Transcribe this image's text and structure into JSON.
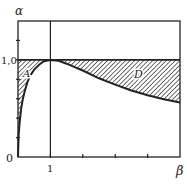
{
  "diagram": {
    "y_axis_label": "α",
    "x_axis_label": "β",
    "y_tick_label_one": "1,0",
    "origin_label": "0",
    "x_tick_label_one": "1",
    "region_labels": {
      "left": "A",
      "right": "D"
    },
    "x_range": [
      0,
      5
    ],
    "y_range": [
      0,
      1.4
    ],
    "x_ticks": [
      1,
      2,
      3,
      4
    ],
    "y_ticks": [
      0.2,
      0.4,
      0.6,
      0.8,
      1.0,
      1.2
    ],
    "reference_level": 1.0,
    "reference_beta": 1,
    "curve": [
      [
        0,
        0
      ],
      [
        0.02,
        0.22
      ],
      [
        0.05,
        0.35
      ],
      [
        0.1,
        0.5
      ],
      [
        0.15,
        0.6
      ],
      [
        0.2,
        0.67
      ],
      [
        0.3,
        0.78
      ],
      [
        0.4,
        0.85
      ],
      [
        0.5,
        0.9
      ],
      [
        0.65,
        0.95
      ],
      [
        0.8,
        0.985
      ],
      [
        1,
        1
      ],
      [
        1.25,
        0.99
      ],
      [
        1.5,
        0.96
      ],
      [
        1.75,
        0.925
      ],
      [
        2,
        0.89
      ],
      [
        2.5,
        0.81
      ],
      [
        3,
        0.745
      ],
      [
        3.5,
        0.685
      ],
      [
        4,
        0.635
      ],
      [
        4.5,
        0.595
      ],
      [
        5,
        0.56
      ]
    ],
    "colors": {
      "ink": "#222222",
      "background": "#ffffff"
    }
  }
}
